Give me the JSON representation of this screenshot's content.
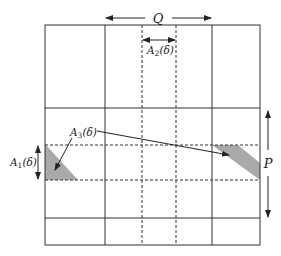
{
  "diagram": {
    "labels": {
      "Q": "Q",
      "P": "P",
      "A1": "A",
      "A1_sub": "1",
      "A1_arg": "(δ)",
      "A2": "A",
      "A2_sub": "2",
      "A2_arg": "(δ)",
      "A3": "A",
      "A3_sub": "3",
      "A3_arg": "(δ)"
    },
    "colors": {
      "line": "#333333",
      "shade": "#a9a9a9",
      "background": "#ffffff"
    }
  }
}
